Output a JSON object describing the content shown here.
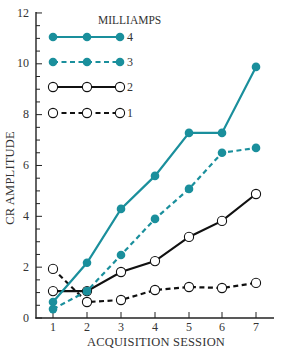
{
  "chart_data": {
    "type": "line",
    "title": "",
    "xlabel": "ACQUISITION SESSION",
    "ylabel": "CR AMPLITUDE",
    "x": [
      1,
      2,
      3,
      4,
      5,
      6,
      7
    ],
    "x_tick_labels": [
      "1",
      "2",
      "3",
      "4",
      "5",
      "6",
      "7"
    ],
    "y_tick_labels": [
      "0",
      "2",
      "4",
      "6",
      "8",
      "10",
      "12"
    ],
    "ylim": [
      0,
      12
    ],
    "xlim": [
      0.5,
      7.5
    ],
    "grid": false,
    "legend_title": "MILLIAMPS",
    "legend_position": "upper-left (inside plot)",
    "series": [
      {
        "name": "4",
        "color": "#1a8f9c",
        "marker": "filled-circle",
        "line": "solid",
        "values": [
          0.63,
          2.17,
          4.29,
          5.59,
          7.28,
          7.28,
          9.88
        ]
      },
      {
        "name": "3",
        "color": "#1a8f9c",
        "marker": "filled-circle",
        "line": "dashed",
        "values": [
          0.35,
          1.06,
          2.48,
          3.9,
          5.08,
          6.5,
          6.69
        ]
      },
      {
        "name": "2",
        "color": "#111111",
        "marker": "open-circle",
        "line": "solid",
        "values": [
          1.06,
          1.06,
          1.81,
          2.24,
          3.19,
          3.82,
          4.88
        ]
      },
      {
        "name": "1",
        "color": "#111111",
        "marker": "open-circle",
        "line": "dashed",
        "values": [
          1.93,
          0.63,
          0.71,
          1.1,
          1.22,
          1.18,
          1.38
        ]
      }
    ]
  },
  "labels": {
    "xlabel": "ACQUISITION SESSION",
    "ylabel": "CR AMPLITUDE",
    "legend_title": "MILLIAMPS",
    "y_ticks": [
      "0",
      "2",
      "4",
      "6",
      "8",
      "10",
      "12"
    ],
    "x_ticks": [
      "1",
      "2",
      "3",
      "4",
      "5",
      "6",
      "7"
    ],
    "legend": [
      "4",
      "3",
      "2",
      "1"
    ]
  },
  "colors": {
    "teal": "#1a8f9c",
    "black": "#111111",
    "axis": "#222222"
  }
}
